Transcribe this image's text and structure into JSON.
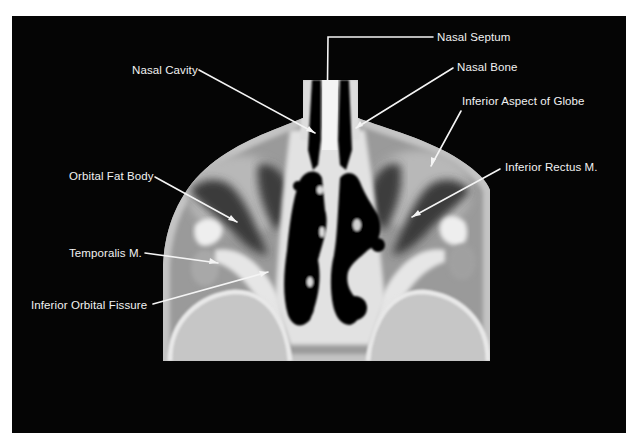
{
  "figure": {
    "type": "axial CT scan",
    "background_color": "#050505",
    "label_color": "#f2f2f2"
  },
  "labels": [
    {
      "id": "nasal-septum",
      "text": "Nasal Septum",
      "x": 437,
      "y": 31,
      "pointer": [
        [
          433,
          37
        ],
        [
          328,
          37
        ],
        [
          327,
          127
        ]
      ]
    },
    {
      "id": "nasal-cavity",
      "text": "Nasal Cavity",
      "x": 132,
      "y": 64,
      "pointer": [
        [
          199,
          70
        ],
        [
          315,
          133
        ]
      ]
    },
    {
      "id": "nasal-bone",
      "text": "Nasal Bone",
      "x": 457,
      "y": 61,
      "pointer": [
        [
          453,
          68
        ],
        [
          356,
          128
        ]
      ]
    },
    {
      "id": "inferior-aspect-of-globe",
      "text": "Inferior Aspect of Globe",
      "x": 462,
      "y": 95,
      "pointer": [
        [
          461,
          111
        ],
        [
          431,
          166
        ]
      ]
    },
    {
      "id": "inferior-rectus",
      "text": "Inferior Rectus M.",
      "x": 505,
      "y": 161,
      "pointer": [
        [
          500,
          169
        ],
        [
          412,
          217
        ]
      ]
    },
    {
      "id": "orbital-fat-body",
      "text": "Orbital Fat Body",
      "x": 69,
      "y": 170,
      "pointer": [
        [
          155,
          177
        ],
        [
          237,
          222
        ]
      ]
    },
    {
      "id": "temporalis",
      "text": "Temporalis M.",
      "x": 69,
      "y": 247,
      "pointer": [
        [
          145,
          253
        ],
        [
          218,
          263
        ]
      ]
    },
    {
      "id": "inferior-orbital-fissure",
      "text": "Inferior Orbital Fissure",
      "x": 31,
      "y": 299,
      "pointer": [
        [
          153,
          304
        ],
        [
          268,
          272
        ]
      ]
    }
  ]
}
